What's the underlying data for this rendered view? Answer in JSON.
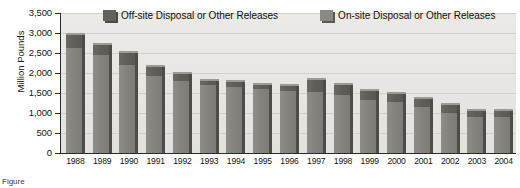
{
  "chart_data": {
    "type": "bar",
    "title": "",
    "xlabel": "",
    "ylabel": "Million Pounds",
    "ylim": [
      0,
      3500
    ],
    "ytick_values": [
      0,
      500,
      1000,
      1500,
      2000,
      2500,
      3000,
      3500
    ],
    "ytick_labels": [
      "0",
      "500",
      "1,000",
      "1,500",
      "2,000",
      "2,500",
      "3,000",
      "3,500"
    ],
    "grid": true,
    "legend_position": "top-center",
    "stacked": true,
    "categories": [
      "1988",
      "1989",
      "1990",
      "1991",
      "1992",
      "1993",
      "1994",
      "1995",
      "1996",
      "1997",
      "1998",
      "1999",
      "2000",
      "2001",
      "2002",
      "2003",
      "2004"
    ],
    "series": [
      {
        "name": "On-site Disposal or Other Releases",
        "values": [
          2620,
          2440,
          2200,
          1920,
          1800,
          1700,
          1660,
          1600,
          1550,
          1520,
          1440,
          1330,
          1280,
          1160,
          1010,
          900,
          890
        ]
      },
      {
        "name": "Off-site Disposal or Other Releases",
        "values": [
          330,
          250,
          310,
          240,
          180,
          110,
          110,
          110,
          130,
          300,
          250,
          220,
          200,
          180,
          190,
          160,
          160
        ]
      }
    ],
    "totals": [
      2950,
      2690,
      2510,
      2160,
      1980,
      1810,
      1770,
      1710,
      1680,
      1820,
      1690,
      1550,
      1480,
      1340,
      1200,
      1060,
      1050
    ]
  },
  "legend": {
    "items": [
      {
        "label": "Off-site Disposal or Other Releases",
        "swatch": "off"
      },
      {
        "label": "On-site Disposal or Other Releases",
        "swatch": "on"
      }
    ]
  },
  "caption": {
    "text": "Figure"
  }
}
